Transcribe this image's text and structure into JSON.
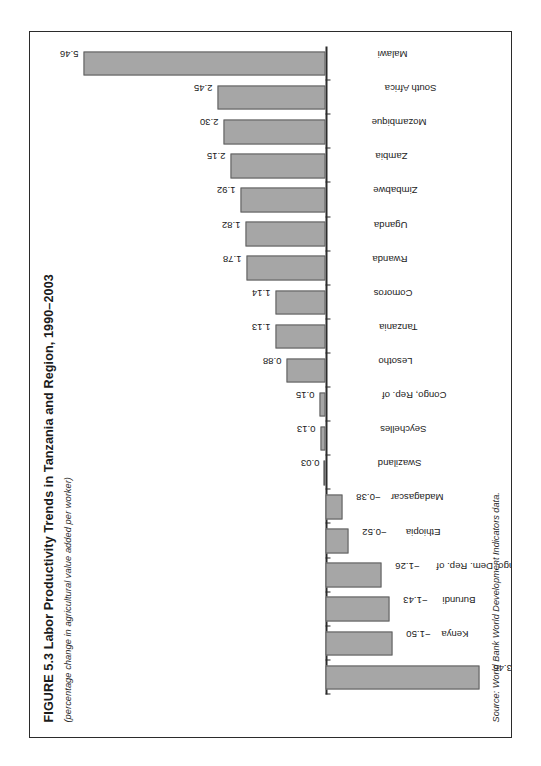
{
  "figure": {
    "title": "FIGURE 5.3  Labor Productivity Trends in Tanzania and Region, 1990–2003",
    "subtitle": "(percentage change in agricultural value added per worker)",
    "source": "Source: World Bank World Development Indicators data.",
    "bar_fill": "#a6a6a6",
    "bar_stroke": "#5d5d5d",
    "frame_color": "#2b2b2b"
  },
  "chart_data": {
    "type": "bar",
    "title": "FIGURE 5.3  Labor Productivity Trends in Tanzania and Region, 1990–2003",
    "subtitle": "(percentage change in agricultural value added per worker)",
    "xlabel": "",
    "ylabel": "percentage change in agricultural value added per worker",
    "ylim": [
      -3.46,
      5.46
    ],
    "grid": false,
    "legend": false,
    "orientation": "vertical",
    "categories": [
      "Botswana",
      "Kenya",
      "Burundi",
      "Congo, Dem. Rep. of",
      "Ethiopia",
      "Madagascar",
      "Swaziland",
      "Seychelles",
      "Congo, Rep. of",
      "Lesotho",
      "Tanzania",
      "Comoros",
      "Rwanda",
      "Uganda",
      "Zimbabwe",
      "Zambia",
      "Mozambique",
      "South Africa",
      "Malawi"
    ],
    "values": [
      -3.46,
      -1.5,
      -1.43,
      -1.26,
      -0.52,
      -0.38,
      0.03,
      0.13,
      0.15,
      0.88,
      1.13,
      1.14,
      1.78,
      1.82,
      1.92,
      2.15,
      2.3,
      2.45,
      5.46
    ],
    "value_labels": [
      "−3.46",
      "−1.50",
      "−1.43",
      "−1.26",
      "−0.52",
      "−0.38",
      "0.03",
      "0.13",
      "0.15",
      "0.88",
      "1.13",
      "1.14",
      "1.78",
      "1.82",
      "1.92",
      "2.15",
      "2.30",
      "2.45",
      "5.46"
    ]
  }
}
